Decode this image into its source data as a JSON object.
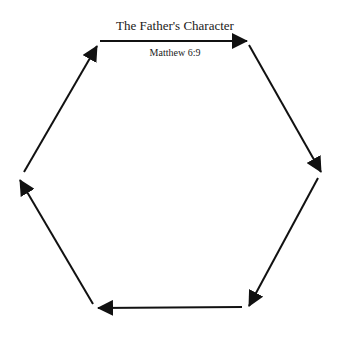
{
  "diagram": {
    "title": "The Father's Character",
    "subtitle": "Matthew 6:9",
    "shape": "hexagon-cycle",
    "stroke_color": "#111111",
    "arrows": [
      {
        "name": "top",
        "x1": 100,
        "y1": 41,
        "x2": 247,
        "y2": 41
      },
      {
        "name": "upper-right",
        "x1": 249,
        "y1": 45,
        "x2": 321,
        "y2": 172
      },
      {
        "name": "lower-right",
        "x1": 318,
        "y1": 178,
        "x2": 249,
        "y2": 306
      },
      {
        "name": "bottom",
        "x1": 242,
        "y1": 307,
        "x2": 98,
        "y2": 308
      },
      {
        "name": "lower-left",
        "x1": 93,
        "y1": 304,
        "x2": 20,
        "y2": 180
      },
      {
        "name": "upper-left",
        "x1": 24,
        "y1": 172,
        "x2": 97,
        "y2": 46
      }
    ]
  }
}
